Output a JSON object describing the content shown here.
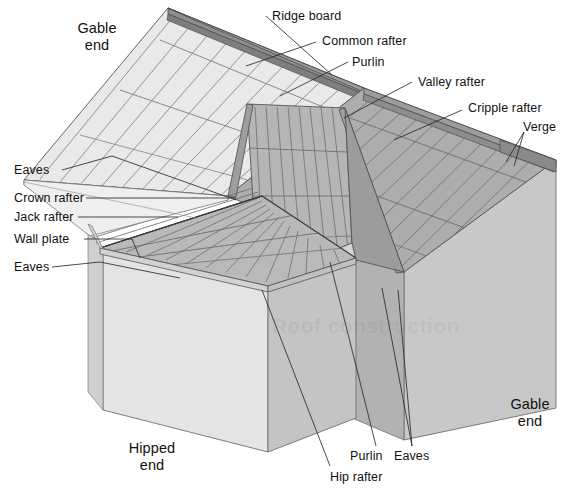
{
  "diagram": {
    "type": "architectural-cutaway",
    "background_color": "#ffffff",
    "line_color": "#4a4a4a",
    "text_color": "#111111"
  },
  "labels": {
    "ridge_board": "Ridge board",
    "common_rafter": "Common rafter",
    "purlin_top": "Purlin",
    "valley_rafter": "Valley rafter",
    "cripple_rafter": "Cripple rafter",
    "verge": "Verge",
    "eaves_upper": "Eaves",
    "crown_rafter": "Crown rafter",
    "jack_rafter": "Jack rafter",
    "wall_plate": "Wall plate",
    "eaves_lower": "Eaves",
    "purlin_bottom": "Purlin",
    "eaves_bottom": "Eaves",
    "hip_rafter": "Hip rafter",
    "gable_end_left": "Gable\nend",
    "gable_end_left_line1": "Gable",
    "gable_end_left_line2": "end",
    "gable_end_right_line1": "Gable",
    "gable_end_right_line2": "end",
    "hipped_end_line1": "Hipped",
    "hipped_end_line2": "end"
  },
  "watermark": {
    "text": "Roof construction"
  },
  "palette": {
    "roof_left_light": "#e9e9e9",
    "roof_left_light_2": "#e2e2e2",
    "roof_ridge_dark": "#8e8e8e",
    "roof_mid_gray": "#a9a9a9",
    "roof_mid_gray_2": "#b4b4b4",
    "roof_dark_gray": "#9a9a9a",
    "roof_underside": "#bdbdbd",
    "wall_front_light": "#e4e4e4",
    "wall_right_gray": "#c8c8c8",
    "wall_shadow": "#b0b0b0",
    "hip_roof_gray": "#b8b8b8",
    "fascia_dark": "#8a8a8a"
  },
  "geometry_note": {
    "projection": "axonometric",
    "structures": [
      "gable-end roof left",
      "hipped end front",
      "valley junction centre",
      "gable end right"
    ]
  }
}
